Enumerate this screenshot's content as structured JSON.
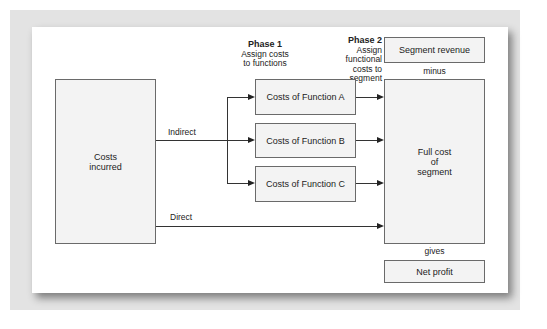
{
  "phases": [
    {
      "title": "Phase 1",
      "desc_line1": "Assign costs",
      "desc_line2": "to functions"
    },
    {
      "title": "Phase 2",
      "desc_line1": "Assign functional",
      "desc_line2": "costs to segment"
    }
  ],
  "nodes": {
    "costs_incurred": {
      "line1": "Costs",
      "line2": "incurred"
    },
    "function_a": "Costs of Function A",
    "function_b": "Costs of Function B",
    "function_c": "Costs of Function C",
    "full_cost": {
      "line1": "Full cost",
      "line2": "of",
      "line3": "segment"
    },
    "segment_revenue": "Segment revenue",
    "net_profit": "Net profit"
  },
  "edges": {
    "indirect": "Indirect",
    "direct": "Direct",
    "minus": "minus",
    "gives": "gives"
  }
}
